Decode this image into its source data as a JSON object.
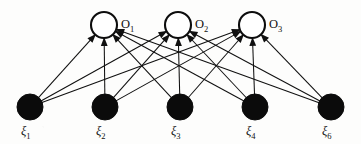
{
  "figure": {
    "background_color": "#fdfdfc",
    "ink_color": "#101010",
    "width": 361,
    "height": 144
  },
  "diagram_data": {
    "type": "bipartite-graph",
    "description": "Two-layer feedforward neural network: five input units fully connected to three output units by directed arrows.",
    "layers": [
      {
        "name": "output",
        "style": "hollow-circle",
        "fill": "#ffffff",
        "stroke": "#0d0d0d",
        "radius": 13,
        "y": 25,
        "nodes": [
          {
            "id": "O1",
            "label": "O",
            "subscript": "1",
            "cx": 104,
            "cy": 25,
            "label_x": 121,
            "label_y": 18
          },
          {
            "id": "O2",
            "label": "O",
            "subscript": "2",
            "cx": 178,
            "cy": 25,
            "label_x": 195,
            "label_y": 18
          },
          {
            "id": "O3",
            "label": "O",
            "subscript": "3",
            "cx": 252,
            "cy": 25,
            "label_x": 269,
            "label_y": 18
          }
        ]
      },
      {
        "name": "input",
        "style": "filled-circle",
        "fill": "#0b0b0b",
        "stroke": "#0b0b0b",
        "radius": 13,
        "y": 107,
        "nodes": [
          {
            "id": "x1",
            "label": "ξ",
            "subscript": "1",
            "cx": 30,
            "cy": 107,
            "label_x": 21,
            "label_y": 125
          },
          {
            "id": "x2",
            "label": "ξ",
            "subscript": "2",
            "cx": 105,
            "cy": 107,
            "label_x": 96,
            "label_y": 125
          },
          {
            "id": "x3",
            "label": "ξ",
            "subscript": "3",
            "cx": 180,
            "cy": 107,
            "label_x": 171,
            "label_y": 125
          },
          {
            "id": "x4",
            "label": "ξ",
            "subscript": "4",
            "cx": 255,
            "cy": 107,
            "label_x": 246,
            "label_y": 125
          },
          {
            "id": "x5",
            "label": "ξ",
            "subscript": "6",
            "cx": 331,
            "cy": 107,
            "label_x": 322,
            "label_y": 125
          }
        ]
      }
    ],
    "edges": [
      {
        "from": "x1",
        "to": "O1"
      },
      {
        "from": "x1",
        "to": "O2"
      },
      {
        "from": "x1",
        "to": "O3"
      },
      {
        "from": "x2",
        "to": "O1"
      },
      {
        "from": "x2",
        "to": "O2"
      },
      {
        "from": "x2",
        "to": "O3"
      },
      {
        "from": "x3",
        "to": "O1"
      },
      {
        "from": "x3",
        "to": "O2"
      },
      {
        "from": "x3",
        "to": "O3"
      },
      {
        "from": "x4",
        "to": "O1"
      },
      {
        "from": "x4",
        "to": "O2"
      },
      {
        "from": "x4",
        "to": "O3"
      },
      {
        "from": "x5",
        "to": "O1"
      },
      {
        "from": "x5",
        "to": "O2"
      },
      {
        "from": "x5",
        "to": "O3"
      }
    ],
    "edge_count": 15,
    "directed": true,
    "arrowhead_at": "output"
  }
}
